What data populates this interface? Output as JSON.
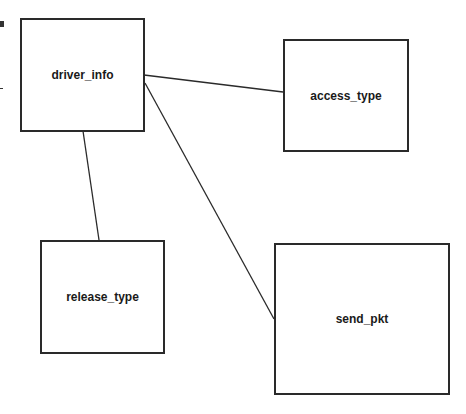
{
  "diagram": {
    "nodes": [
      {
        "id": "driver_info",
        "label": "driver_info",
        "x": 20,
        "y": 18,
        "w": 125,
        "h": 114
      },
      {
        "id": "access_type",
        "label": "access_type",
        "x": 283,
        "y": 39,
        "w": 126,
        "h": 113
      },
      {
        "id": "release_type",
        "label": "release_type",
        "x": 40,
        "y": 240,
        "w": 125,
        "h": 114
      },
      {
        "id": "send_pkt",
        "label": "send_pkt",
        "x": 274,
        "y": 243,
        "w": 176,
        "h": 152
      }
    ],
    "edges": [
      {
        "from": "driver_info",
        "to": "access_type"
      },
      {
        "from": "driver_info",
        "to": "release_type"
      },
      {
        "from": "driver_info",
        "to": "send_pkt"
      }
    ],
    "colors": {
      "stroke": "#2a2a2a",
      "background": "#ffffff"
    }
  }
}
